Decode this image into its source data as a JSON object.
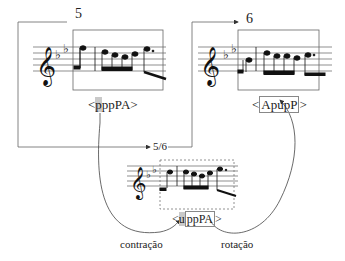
{
  "diagram": {
    "panels": [
      {
        "id": "m5",
        "number": "5",
        "label_prefix": "<",
        "label_highlight": "p",
        "label_rest": "ppPA",
        "label_suffix": ">"
      },
      {
        "id": "m6",
        "number": "6",
        "label_prefix": "<",
        "label_boxed": "ApupP",
        "label_suffix": ">"
      },
      {
        "id": "m56",
        "number": "5/6",
        "label_prefix": "<",
        "label_highlight": "u",
        "label_boxed_rest": "ppPA",
        "label_suffix": ">"
      }
    ],
    "edges": [
      {
        "from": "m5",
        "to": "m56",
        "label": "contração"
      },
      {
        "from": "m56",
        "to": "m6",
        "label": "rotação"
      }
    ],
    "key_signature": "B-flat major (two flats)",
    "clef": "treble"
  }
}
